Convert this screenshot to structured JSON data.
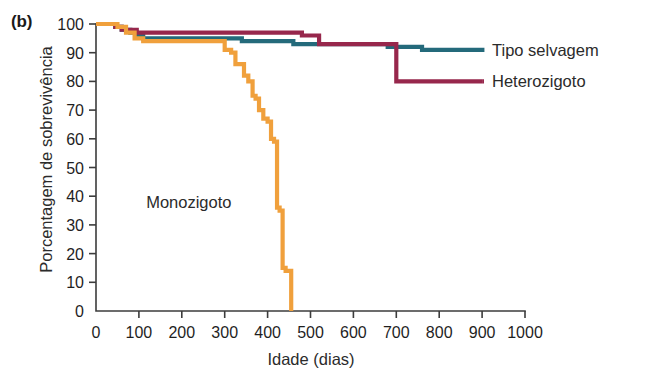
{
  "figure": {
    "panel_label": "(b)",
    "y_axis_title": "Porcentagem de sobrevivência",
    "x_axis_title": "Idade (dias)"
  },
  "labels": {
    "wild_type": "Tipo selvagem",
    "heterozygote": "Heterozigoto",
    "monozygote": "Monozigoto"
  },
  "colors": {
    "wild_type": "#246a7b",
    "heterozygote": "#97274c",
    "monozygote": "#f0a03c",
    "axis": "#3c3c3c",
    "text": "#1f1f1f",
    "background": "#ffffff"
  },
  "chart_data": {
    "type": "line",
    "title": "",
    "subtitle": "",
    "xlabel": "Idade (dias)",
    "ylabel": "Porcentagem de sobrevivência",
    "xlim": [
      0,
      1000
    ],
    "ylim": [
      0,
      100
    ],
    "xticks": [
      0,
      100,
      200,
      300,
      400,
      500,
      600,
      700,
      800,
      900,
      1000
    ],
    "yticks": [
      0,
      10,
      20,
      30,
      40,
      50,
      60,
      70,
      80,
      90,
      100
    ],
    "grid": false,
    "legend_position": "right-inline",
    "step_style": "post",
    "annotations": [
      {
        "text": "Monozigoto",
        "x": 420,
        "y": 38
      },
      {
        "text": "(b)",
        "x": 0,
        "y": 100
      }
    ],
    "series": [
      {
        "name": "Tipo selvagem",
        "color": "#246a7b",
        "x": [
          0,
          30,
          45,
          60,
          80,
          95,
          110,
          130,
          160,
          200,
          250,
          300,
          340,
          410,
          460,
          520,
          620,
          680,
          760,
          860,
          905
        ],
        "y": [
          100,
          100,
          99,
          98,
          97,
          96,
          95,
          95,
          95,
          95,
          95,
          95,
          94,
          94,
          93,
          93,
          93,
          92,
          91,
          91,
          91
        ]
      },
      {
        "name": "Heterozigoto",
        "color": "#97274c",
        "x": [
          0,
          30,
          45,
          60,
          80,
          95,
          110,
          140,
          180,
          230,
          290,
          350,
          420,
          480,
          520,
          560,
          620,
          670,
          700,
          800,
          900
        ],
        "y": [
          100,
          100,
          99,
          98,
          98,
          97,
          97,
          97,
          97,
          97,
          97,
          97,
          97,
          96,
          93,
          93,
          93,
          93,
          80,
          80,
          80
        ]
      },
      {
        "name": "Monozigoto",
        "color": "#f0a03c",
        "x": [
          0,
          30,
          50,
          70,
          90,
          110,
          140,
          180,
          230,
          280,
          300,
          315,
          325,
          335,
          345,
          355,
          365,
          372,
          380,
          390,
          400,
          408,
          415,
          422,
          428,
          435,
          442,
          448,
          455
        ],
        "y": [
          100,
          100,
          99,
          97,
          95,
          94,
          94,
          94,
          94,
          94,
          91,
          90,
          86,
          86,
          82,
          80,
          75,
          74,
          70,
          67,
          66,
          60,
          59,
          36,
          35,
          15,
          14,
          14,
          0
        ]
      }
    ]
  }
}
